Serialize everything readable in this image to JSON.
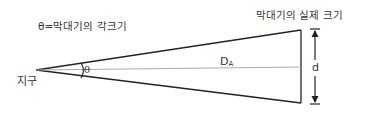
{
  "diagram": {
    "title_angle_definition": "θ=막대기의 각크기",
    "title_actual_size": "막대기의 실제 크기",
    "origin_label": "지구",
    "angle_symbol": "θ",
    "distance_label": "D",
    "distance_subscript": "A",
    "size_label": "d",
    "colors": {
      "lines": "#222222",
      "center_line": "#aaaaaa",
      "text": "#333333",
      "background": "#ffffff"
    }
  }
}
